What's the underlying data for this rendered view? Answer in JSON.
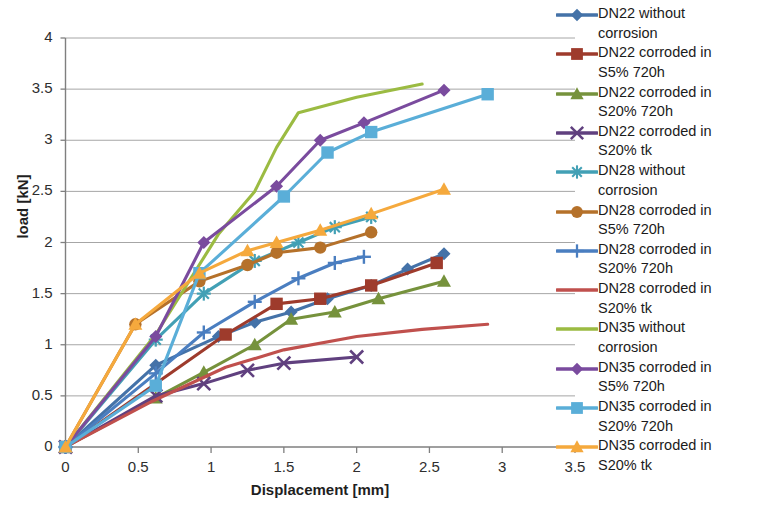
{
  "chart_data": {
    "type": "line",
    "title": "",
    "xlabel": "Displacement [mm]",
    "ylabel": "load [kN]",
    "xlim": [
      0,
      3.5
    ],
    "ylim": [
      0,
      4
    ],
    "xticks": [
      "0",
      "0.5",
      "1",
      "1.5",
      "2",
      "2.5",
      "3",
      "3.5"
    ],
    "xtick_values": [
      0,
      0.5,
      1,
      1.5,
      2,
      2.5,
      3,
      3.5
    ],
    "yticks": [
      "0",
      "0.5",
      "1",
      "1.5",
      "2",
      "2.5",
      "3",
      "3.5",
      "4"
    ],
    "ytick_values": [
      0,
      0.5,
      1,
      1.5,
      2,
      2.5,
      3,
      3.5,
      4
    ],
    "grid": "horizontal",
    "legend_position": "right",
    "series": [
      {
        "name": "DN22 without corrosion",
        "label_line1": "DN22 without",
        "label_line2": "corrosion",
        "color": "#4472a8",
        "marker": "diamond",
        "x": [
          0,
          0.62,
          1.05,
          1.3,
          1.55,
          1.8,
          2.1,
          2.35,
          2.6
        ],
        "y": [
          0,
          0.8,
          1.08,
          1.22,
          1.32,
          1.45,
          1.58,
          1.74,
          1.89
        ]
      },
      {
        "name": "DN22 corroded in S5% 720h",
        "label_line1": "DN22 corroded in",
        "label_line2": "S5% 720h",
        "color": "#9e3b2c",
        "marker": "square",
        "x": [
          0,
          1.1,
          1.45,
          1.75,
          2.1,
          2.55
        ],
        "y": [
          0,
          1.1,
          1.4,
          1.45,
          1.58,
          1.8
        ]
      },
      {
        "name": "DN22 corroded in S20% 720h",
        "label_line1": "DN22 corroded in",
        "label_line2": "S20% 720h",
        "color": "#76923c",
        "marker": "triangle",
        "x": [
          0,
          0.62,
          0.95,
          1.3,
          1.55,
          1.85,
          2.15,
          2.6
        ],
        "y": [
          0,
          0.48,
          0.73,
          1.0,
          1.25,
          1.32,
          1.45,
          1.62
        ]
      },
      {
        "name": "DN22 corroded in S20% tk",
        "label_line1": "DN22 corroded in",
        "label_line2": "S20% tk",
        "color": "#60407f",
        "marker": "cross-x",
        "x": [
          0,
          0.62,
          0.95,
          1.25,
          1.5,
          2.0
        ],
        "y": [
          0,
          0.5,
          0.62,
          0.75,
          0.82,
          0.88
        ]
      },
      {
        "name": "DN28 without corrosion",
        "label_line1": "DN28 without",
        "label_line2": "corrosion",
        "color": "#42a0b5",
        "marker": "asterisk",
        "x": [
          0,
          0.62,
          0.95,
          1.3,
          1.6,
          1.85,
          2.1
        ],
        "y": [
          0,
          1.05,
          1.5,
          1.82,
          2.0,
          2.15,
          2.25
        ]
      },
      {
        "name": "DN28 corroded in S5% 720h",
        "label_line1": "DN28 corroded in",
        "label_line2": "S5% 720h",
        "color": "#b5712a",
        "marker": "circle",
        "x": [
          0,
          0.48,
          0.92,
          1.25,
          1.45,
          1.75,
          2.1
        ],
        "y": [
          0,
          1.2,
          1.62,
          1.78,
          1.9,
          1.95,
          2.1
        ]
      },
      {
        "name": "DN28 corroded in S20% 720h",
        "label_line1": "DN28 corroded in",
        "label_line2": "S20% 720h",
        "color": "#4a7ec0",
        "marker": "plus",
        "x": [
          0,
          0.62,
          0.95,
          1.3,
          1.6,
          1.85,
          2.05
        ],
        "y": [
          0,
          0.72,
          1.12,
          1.42,
          1.65,
          1.8,
          1.86
        ]
      },
      {
        "name": "DN28 corroded in S20% tk",
        "label_line1": "DN28 corroded in",
        "label_line2": "S20% tk",
        "color": "#c0504d",
        "marker": "none",
        "x": [
          0,
          0.6,
          1.1,
          1.5,
          2.0,
          2.45,
          2.9
        ],
        "y": [
          0,
          0.45,
          0.78,
          0.95,
          1.08,
          1.15,
          1.2
        ]
      },
      {
        "name": "DN35 without corrosion",
        "label_line1": "DN35 without",
        "label_line2": "corrosion",
        "color": "#9bbb42",
        "marker": "none",
        "x": [
          0,
          0.62,
          1.05,
          1.3,
          1.45,
          1.6,
          2.0,
          2.45
        ],
        "y": [
          0,
          1.1,
          2.08,
          2.5,
          2.93,
          3.27,
          3.42,
          3.55
        ]
      },
      {
        "name": "DN35 corroded in S5% 720h",
        "label_line1": "DN35 corroded in",
        "label_line2": "S5% 720h",
        "color": "#7a4b9e",
        "marker": "diamond",
        "x": [
          0,
          0.62,
          0.95,
          1.45,
          1.75,
          2.05,
          2.6
        ],
        "y": [
          0,
          1.08,
          2.0,
          2.55,
          3.0,
          3.17,
          3.49
        ]
      },
      {
        "name": "DN35 corroded in S20% 720h",
        "label_line1": "DN35 corroded in",
        "label_line2": "S20% 720h",
        "color": "#5aaed8",
        "marker": "square",
        "x": [
          0,
          0.62,
          0.92,
          1.5,
          1.8,
          2.1,
          2.9
        ],
        "y": [
          0,
          0.6,
          1.7,
          2.45,
          2.88,
          3.08,
          3.45
        ]
      },
      {
        "name": "DN35 corroded in S20% tk",
        "label_line1": "DN35 corroded in",
        "label_line2": "S20% tk",
        "color": "#f5a93d",
        "marker": "triangle",
        "x": [
          0,
          0.48,
          0.92,
          1.25,
          1.45,
          1.75,
          2.1,
          2.6
        ],
        "y": [
          0,
          1.2,
          1.7,
          1.92,
          2.0,
          2.12,
          2.28,
          2.52
        ]
      }
    ]
  }
}
